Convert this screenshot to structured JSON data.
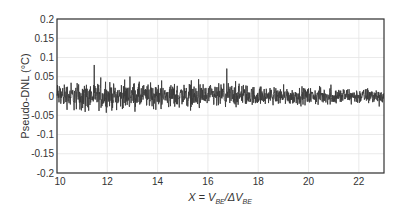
{
  "chart_data": {
    "type": "line",
    "title": "",
    "xlabel": "X = V_BE / ΔV_BE",
    "xlabel_parts": {
      "main": "X = V",
      "sub1": "BE",
      "mid": "/ΔV",
      "sub2": "BE"
    },
    "ylabel": "Pseudo-DNL (°C)",
    "xlim": [
      10,
      23
    ],
    "ylim": [
      -0.2,
      0.2
    ],
    "xticks": [
      10,
      12,
      14,
      16,
      18,
      20,
      22
    ],
    "xtick_labels": [
      "10",
      "12",
      "14",
      "16",
      "18",
      "20",
      "22"
    ],
    "yticks": [
      -0.2,
      -0.15,
      -0.1,
      -0.05,
      0,
      0.05,
      0.1,
      0.15,
      0.2
    ],
    "ytick_labels": [
      "-0.2",
      "-0.15",
      "-0.1",
      "-0.05",
      "0",
      "0.05",
      "0.1",
      "0.15",
      "0.2"
    ],
    "grid": true,
    "legend": null,
    "series": [
      {
        "name": "Pseudo-DNL",
        "color": "#3a3a3a",
        "description": "Dense noise-like signal centered at 0; typical band about ±0.04, peaks up to ~+0.1 and down to ~-0.105 near X≈10.5; amplitude slightly decreasing toward X=23",
        "envelope": {
          "x": [
            10,
            11,
            12,
            13,
            14,
            15,
            16,
            17,
            18,
            19,
            20,
            21,
            22,
            23
          ],
          "max": [
            0.1,
            0.09,
            0.085,
            0.09,
            0.075,
            0.09,
            0.07,
            0.09,
            0.065,
            0.06,
            0.055,
            0.06,
            0.05,
            0.05
          ],
          "min": [
            -0.06,
            -0.105,
            -0.08,
            -0.08,
            -0.085,
            -0.07,
            -0.095,
            -0.07,
            -0.055,
            -0.055,
            -0.055,
            -0.055,
            -0.05,
            -0.055
          ]
        }
      }
    ],
    "colors": {
      "frame": "#333333",
      "grid": "#e4e4e4",
      "line": "#3a3a3a"
    }
  }
}
